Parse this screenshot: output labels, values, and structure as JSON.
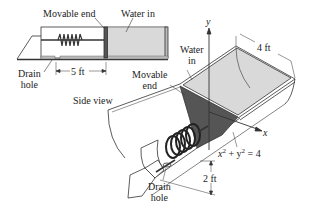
{
  "side_view": {
    "movable_end_label": "Movable end",
    "water_in_label": "Water in",
    "drain_label_line1": "Drain",
    "drain_label_line2": "hole",
    "length_label": "5 ft",
    "caption": "Side view"
  },
  "perspective_view": {
    "y_axis_label": "y",
    "x_axis_label": "x",
    "water_label_line1": "Water",
    "water_label_line2": "in",
    "movable_label_line1": "Movable",
    "movable_label_line2": "end",
    "width_label": "4 ft",
    "equation_base_x": "x",
    "equation_exp1": "2",
    "equation_mid": " + y",
    "equation_exp2": "2",
    "equation_rhs": " = 4",
    "radius_label": "2 ft",
    "drain_label_line1": "Drain",
    "drain_label_line2": "hole"
  },
  "colors": {
    "water": "#d9d9d9",
    "movable_end_fill": "#555555",
    "outline": "#333333"
  }
}
